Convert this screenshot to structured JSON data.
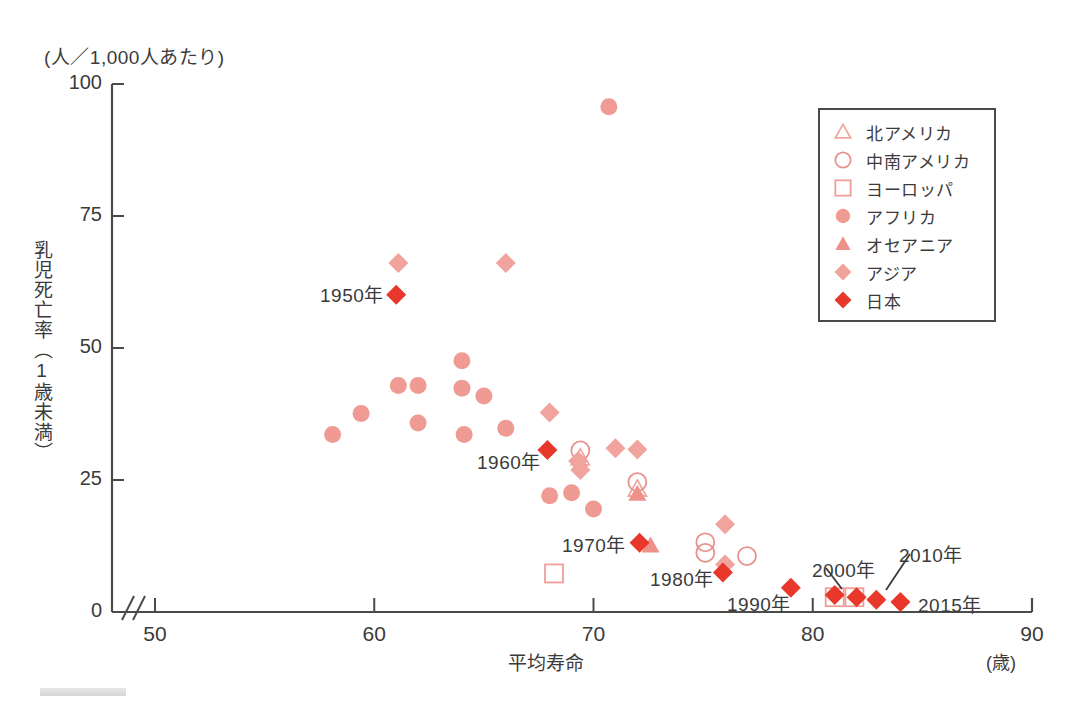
{
  "chart_data": {
    "type": "scatter",
    "title": "",
    "xlabel": "平均寿命",
    "xunit": "(歳)",
    "ylabel": "乳児死亡率（1歳未満）",
    "yunit": "(人／1,000人あたり)",
    "xlim": [
      50,
      90
    ],
    "ylim": [
      0,
      100
    ],
    "xticks": [
      50,
      60,
      70,
      80,
      90
    ],
    "yticks": [
      0,
      25,
      50,
      75,
      100
    ],
    "axis_break": true,
    "grid": false,
    "legend_position": "top-right",
    "series": [
      {
        "name": "北アメリカ",
        "marker": "triangle-open",
        "color": "#f0a9a2",
        "points": [
          [
            69.4,
            29.2
          ],
          [
            72.0,
            23.3
          ]
        ]
      },
      {
        "name": "中南アメリカ",
        "marker": "circle-open",
        "color": "#e8928c",
        "points": [
          [
            69.4,
            30.6
          ],
          [
            72.0,
            24.6
          ],
          [
            75.1,
            13.2
          ],
          [
            75.1,
            11.2
          ],
          [
            77.0,
            10.6
          ]
        ]
      },
      {
        "name": "ヨーロッパ",
        "marker": "square-open",
        "color": "#ef9e98",
        "points": [
          [
            68.2,
            7.3
          ],
          [
            81.0,
            2.8
          ],
          [
            81.9,
            2.8
          ]
        ]
      },
      {
        "name": "アフリカ",
        "marker": "circle-filled",
        "color": "#ef9b94",
        "points": [
          [
            70.7,
            95.7
          ],
          [
            58.1,
            33.6
          ],
          [
            59.4,
            37.6
          ],
          [
            61.1,
            42.9
          ],
          [
            62.0,
            42.9
          ],
          [
            62.0,
            35.8
          ],
          [
            64.0,
            47.6
          ],
          [
            64.0,
            42.4
          ],
          [
            65.0,
            40.9
          ],
          [
            66.0,
            34.8
          ],
          [
            64.1,
            33.6
          ],
          [
            68.0,
            22.0
          ],
          [
            69.0,
            22.6
          ],
          [
            70.0,
            19.5
          ]
        ]
      },
      {
        "name": "オセアニア",
        "marker": "triangle-filled",
        "color": "#ee918a",
        "points": [
          [
            69.4,
            28.2
          ],
          [
            72.0,
            22.4
          ],
          [
            72.6,
            12.6
          ]
        ]
      },
      {
        "name": "アジア",
        "marker": "diamond-filled",
        "color": "#f0a49d",
        "points": [
          [
            61.1,
            66.1
          ],
          [
            66.0,
            66.1
          ],
          [
            68.0,
            37.8
          ],
          [
            69.3,
            28.6
          ],
          [
            69.4,
            26.9
          ],
          [
            71.0,
            31.0
          ],
          [
            72.0,
            30.8
          ],
          [
            76.0,
            16.6
          ],
          [
            76.0,
            9.0
          ]
        ]
      },
      {
        "name": "日本",
        "marker": "diamond-japan",
        "color": "#e8382c",
        "points": [
          [
            61.0,
            60.1
          ],
          [
            67.9,
            30.7
          ],
          [
            72.1,
            13.1
          ],
          [
            75.9,
            7.5
          ],
          [
            79.0,
            4.6
          ],
          [
            81.0,
            3.2
          ],
          [
            82.0,
            2.8
          ],
          [
            82.9,
            2.3
          ],
          [
            84.0,
            1.9
          ]
        ]
      }
    ],
    "annotations": [
      {
        "label": "1950年",
        "text_x": 320,
        "text_y": 280,
        "leader": false
      },
      {
        "label": "1960年",
        "text_x": 477,
        "text_y": 447,
        "leader": false
      },
      {
        "label": "1970年",
        "text_x": 562,
        "text_y": 530,
        "leader": false
      },
      {
        "label": "1980年",
        "text_x": 650,
        "text_y": 564,
        "leader": false
      },
      {
        "label": "1990年",
        "text_x": 727,
        "text_y": 589,
        "leader": false
      },
      {
        "label": "2000年",
        "text_x": 812,
        "text_y": 555,
        "leader": true,
        "lx1": 826,
        "ly1": 568,
        "lx2": 842,
        "ly2": 589
      },
      {
        "label": "2010年",
        "text_x": 899,
        "text_y": 540,
        "leader": true,
        "lx1": 910,
        "ly1": 554,
        "lx2": 886,
        "ly2": 590
      },
      {
        "label": "2015年",
        "text_x": 918,
        "text_y": 590,
        "leader": false
      }
    ]
  },
  "legend": {
    "items": [
      {
        "label": "北アメリカ",
        "marker": "triangle-open",
        "color": "#f0a9a2"
      },
      {
        "label": "中南アメリカ",
        "marker": "circle-open",
        "color": "#e8928c"
      },
      {
        "label": "ヨーロッパ",
        "marker": "square-open",
        "color": "#ef9e98"
      },
      {
        "label": "アフリカ",
        "marker": "circle-filled",
        "color": "#ef9b94"
      },
      {
        "label": "オセアニア",
        "marker": "triangle-filled",
        "color": "#ee918a"
      },
      {
        "label": "アジア",
        "marker": "diamond-filled",
        "color": "#f0a49d"
      },
      {
        "label": "日本",
        "marker": "diamond-japan",
        "color": "#e8382c"
      }
    ]
  },
  "axis": {
    "y_unit_text": "(人／1,000人あたり)",
    "y_title": "乳児死亡率（1歳未満）",
    "x_title": "平均寿命",
    "x_unit_text": "(歳)"
  },
  "colors": {
    "axis": "#4a4a4a",
    "text": "#3b3b3b",
    "japan": "#e8382c",
    "light_marker": "#ef9b94"
  }
}
